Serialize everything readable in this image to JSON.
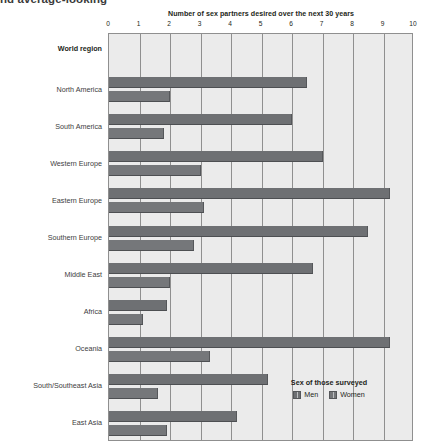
{
  "caption_fragment": "nd average-looking",
  "legend": {
    "title": "Sex of those surveyed",
    "items": [
      {
        "label": "Men",
        "color": "#6e7073"
      },
      {
        "label": "Women",
        "color": "#75777a"
      }
    ]
  },
  "axis": {
    "y_header": "World region",
    "x_tick_labels": [
      "0",
      "1",
      "2",
      "3",
      "4",
      "5",
      "6",
      "7",
      "8",
      "9",
      "10"
    ]
  },
  "chart_data": {
    "type": "bar",
    "orientation": "horizontal",
    "title": "Number of sex partners desired over the next 30 years",
    "xlabel": "Number of sex partners desired over the next 30 years",
    "ylabel": "World region",
    "xlim": [
      0,
      10
    ],
    "xticks": [
      0,
      1,
      2,
      3,
      4,
      5,
      6,
      7,
      8,
      9,
      10
    ],
    "grid": true,
    "legend_position": "inside-bottom-right",
    "categories": [
      "North America",
      "South America",
      "Western Europe",
      "Eastern Europe",
      "Southern Europe",
      "Middle East",
      "Africa",
      "Oceania",
      "South/Southeast Asia",
      "East Asia"
    ],
    "series": [
      {
        "name": "Men",
        "color": "#6e7073",
        "values": [
          6.5,
          6.0,
          7.0,
          9.2,
          8.5,
          6.7,
          1.9,
          9.2,
          5.2,
          4.2
        ]
      },
      {
        "name": "Women",
        "color": "#75777a",
        "values": [
          2.0,
          1.8,
          3.0,
          3.1,
          2.8,
          2.0,
          1.1,
          3.3,
          1.6,
          1.9
        ]
      }
    ]
  }
}
